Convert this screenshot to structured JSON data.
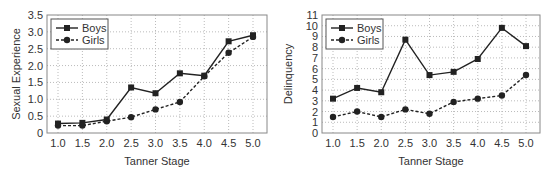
{
  "chart_data": [
    {
      "type": "line",
      "title": "",
      "xlabel": "Tanner Stage",
      "ylabel": "Sexual Experience",
      "x": [
        1.0,
        1.5,
        2.0,
        2.5,
        3.0,
        3.5,
        4.0,
        4.5,
        5.0
      ],
      "x_tick_labels": [
        "1.0",
        "1.5",
        "2.0",
        "2.5",
        "3.0",
        "3.5",
        "4.0",
        "4.5",
        "5.0"
      ],
      "y_ticks": [
        0,
        0.5,
        1.0,
        1.5,
        2.0,
        2.5,
        3.0,
        3.5
      ],
      "y_tick_labels": [
        "0",
        "0.5",
        "1.0",
        "1.5",
        "2.0",
        "2.5",
        "3.0",
        "3.5"
      ],
      "ylim": [
        0,
        3.5
      ],
      "grid": true,
      "legend_position": "upper-left",
      "series": [
        {
          "name": "Boys",
          "marker": "square",
          "line": "solid",
          "values": [
            0.28,
            0.3,
            0.4,
            1.35,
            1.18,
            1.77,
            1.7,
            2.72,
            2.9
          ]
        },
        {
          "name": "Girls",
          "marker": "circle",
          "line": "dashed",
          "values": [
            0.22,
            0.22,
            0.35,
            0.47,
            0.7,
            0.92,
            1.68,
            2.38,
            2.85
          ]
        }
      ]
    },
    {
      "type": "line",
      "title": "",
      "xlabel": "Tanner Stage",
      "ylabel": "Delinquency",
      "x": [
        1.0,
        1.5,
        2.0,
        2.5,
        3.0,
        3.5,
        4.0,
        4.5,
        5.0
      ],
      "x_tick_labels": [
        "1.0",
        "1.5",
        "2.0",
        "2.5",
        "3.0",
        "3.5",
        "4.0",
        "4.5",
        "5.0"
      ],
      "y_ticks": [
        0,
        1,
        2,
        3,
        4,
        5,
        6,
        7,
        8,
        9,
        10,
        11
      ],
      "y_tick_labels": [
        "0",
        "1",
        "2",
        "3",
        "4",
        "5",
        "6",
        "7",
        "8",
        "9",
        "10",
        "11"
      ],
      "ylim": [
        0,
        11
      ],
      "grid": true,
      "legend_position": "upper-left",
      "series": [
        {
          "name": "Boys",
          "marker": "square",
          "line": "solid",
          "values": [
            3.2,
            4.2,
            3.8,
            8.7,
            5.4,
            5.7,
            6.9,
            9.8,
            8.1
          ]
        },
        {
          "name": "Girls",
          "marker": "circle",
          "line": "dashed",
          "values": [
            1.5,
            2.0,
            1.5,
            2.2,
            1.8,
            2.9,
            3.2,
            3.5,
            5.4
          ]
        }
      ]
    }
  ],
  "colors": {
    "line": "#222222",
    "grid": "#bbbbbb",
    "frame": "#888888",
    "text": "#333333"
  }
}
